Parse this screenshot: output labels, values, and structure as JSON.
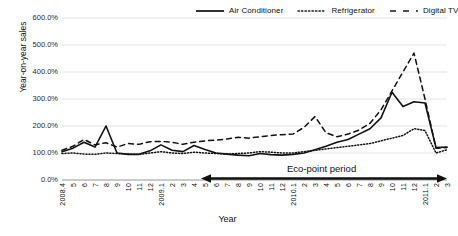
{
  "chart": {
    "title": "",
    "xlabel": "Year",
    "ylabel": "Year-on-year sales",
    "y_ticks": [
      "600.0%",
      "500.0%",
      "400.0%",
      "300.0%",
      "200.0%",
      "100.0%",
      "0.0%"
    ],
    "annotation": "Eco-point period",
    "legend": [
      {
        "label": "Air Conditioner",
        "style": "solid",
        "icon": "solid-line-icon"
      },
      {
        "label": "Refrigerator",
        "style": "dotted",
        "icon": "dotted-line-icon"
      },
      {
        "label": "Digital TV",
        "style": "dashed",
        "icon": "dashed-line-icon"
      }
    ]
  },
  "chart_data": {
    "type": "line",
    "title": "",
    "xlabel": "Year",
    "ylabel": "Year-on-year sales",
    "ylim": [
      0,
      600
    ],
    "ytick_values": [
      0,
      100,
      200,
      300,
      400,
      500,
      600
    ],
    "ytick_labels": [
      "0.0%",
      "100.0%",
      "200.0%",
      "300.0%",
      "400.0%",
      "500.0%",
      "600.0%"
    ],
    "grid": "horizontal",
    "legend_position": "top-right",
    "annotations": [
      {
        "text": "Eco-point period",
        "type": "double-arrow-span",
        "from": "2009.5",
        "to": "2011.3"
      }
    ],
    "categories": [
      "2008.4",
      "5",
      "6",
      "7",
      "8",
      "9",
      "10",
      "11",
      "12",
      "2009.1",
      "2",
      "3",
      "4",
      "5",
      "6",
      "7",
      "8",
      "9",
      "10",
      "11",
      "12",
      "2010.1",
      "2",
      "3",
      "4",
      "5",
      "6",
      "7",
      "8",
      "9",
      "10",
      "11",
      "12",
      "2011.1",
      "2",
      "3"
    ],
    "x_tick_labels": [
      "2008.4",
      "5",
      "6",
      "7",
      "8",
      "9",
      "10",
      "11",
      "12",
      "2009.1",
      "2",
      "3",
      "4",
      "5",
      "6",
      "7",
      "8",
      "9",
      "10",
      "11",
      "12",
      "2010.1",
      "2",
      "3",
      "4",
      "5",
      "6",
      "7",
      "8",
      "9",
      "10",
      "11",
      "12",
      "2011.1",
      "2",
      "3"
    ],
    "series": [
      {
        "name": "Air Conditioner",
        "style": "solid",
        "values": [
          105,
          118,
          140,
          122,
          200,
          100,
          95,
          95,
          108,
          130,
          110,
          105,
          128,
          113,
          100,
          96,
          92,
          90,
          98,
          94,
          92,
          95,
          100,
          112,
          125,
          140,
          150,
          170,
          190,
          230,
          325,
          272,
          290,
          285,
          120,
          122
        ]
      },
      {
        "name": "Refrigerator",
        "style": "dotted",
        "values": [
          98,
          100,
          96,
          95,
          100,
          98,
          96,
          95,
          100,
          105,
          100,
          98,
          103,
          100,
          98,
          96,
          98,
          100,
          105,
          103,
          100,
          100,
          105,
          110,
          115,
          120,
          125,
          130,
          135,
          145,
          155,
          165,
          190,
          183,
          100,
          112
        ]
      },
      {
        "name": "Digital TV",
        "style": "dashed",
        "values": [
          110,
          125,
          150,
          130,
          138,
          122,
          135,
          132,
          142,
          143,
          140,
          132,
          140,
          145,
          148,
          152,
          158,
          155,
          160,
          165,
          168,
          170,
          195,
          235,
          175,
          160,
          170,
          185,
          210,
          260,
          330,
          400,
          470,
          300,
          118,
          120
        ]
      }
    ]
  }
}
